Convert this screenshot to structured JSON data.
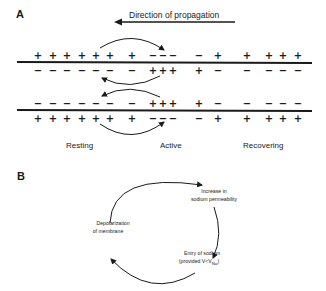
{
  "panel_a": {
    "label": "A",
    "direction_label": "Direction of propagation",
    "direction_icon": "arrow-left-icon",
    "states": [
      "Resting",
      "Active",
      "Recovering"
    ],
    "membrane_top": {
      "outside": [
        "+",
        "+",
        "+",
        "+",
        "+",
        "+",
        "+",
        "−",
        "−",
        "−",
        "−",
        "+",
        "+",
        "+",
        "+",
        "+"
      ],
      "inside": [
        "−",
        "−",
        "−",
        "−",
        "−",
        "−",
        "−",
        "+",
        "+",
        "+",
        "+",
        "−",
        "−",
        "−",
        "−",
        "−"
      ]
    },
    "membrane_bottom": {
      "inside": [
        "−",
        "−",
        "−",
        "−",
        "−",
        "−",
        "−",
        "+",
        "+",
        "+",
        "+",
        "−",
        "−",
        "−",
        "−",
        "−"
      ],
      "outside": [
        "+",
        "+",
        "+",
        "+",
        "+",
        "+",
        "+",
        "−",
        "−",
        "−",
        "−",
        "+",
        "+",
        "+",
        "+",
        "+"
      ]
    }
  },
  "panel_b": {
    "label": "B",
    "cycle_steps": [
      {
        "line1": "Increase in",
        "line2": "sodium permeability"
      },
      {
        "line1": "Entry of sodium",
        "line2": "(provided V<V",
        "subscript": "Na",
        "suffix": ")"
      },
      {
        "line1": "Depolarization",
        "line2": "of membrane"
      }
    ]
  }
}
